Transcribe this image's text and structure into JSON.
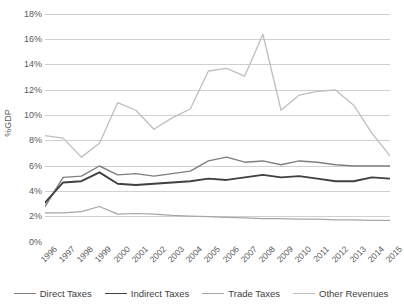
{
  "chart_data": {
    "type": "line",
    "title": "",
    "xlabel": "",
    "ylabel": "%GDP",
    "grid": true,
    "legend_position": "bottom",
    "ylim": [
      0,
      18
    ],
    "ytick_step": 2,
    "ytick_labels": [
      "0%",
      "2%",
      "4%",
      "6%",
      "8%",
      "10%",
      "12%",
      "14%",
      "16%",
      "18%"
    ],
    "ytick_values": [
      0,
      2,
      4,
      6,
      8,
      10,
      12,
      14,
      16,
      18
    ],
    "categories": [
      "1996",
      "1997",
      "1998",
      "1999",
      "2000",
      "2001",
      "2002",
      "2003",
      "2004",
      "2005",
      "2006",
      "2007",
      "2008",
      "2009",
      "2010",
      "2011",
      "2012",
      "2013",
      "2014",
      "2015"
    ],
    "series": [
      {
        "name": "Direct Taxes",
        "color": "#7f7f7f",
        "width": 1.4,
        "values": [
          2.8,
          5.1,
          5.2,
          6.0,
          5.3,
          5.4,
          5.2,
          5.4,
          5.6,
          6.4,
          6.7,
          6.3,
          6.4,
          6.1,
          6.4,
          6.3,
          6.1,
          6.0,
          6.0,
          6.0
        ]
      },
      {
        "name": "Indirect Taxes",
        "color": "#404040",
        "width": 1.9,
        "values": [
          3.1,
          4.7,
          4.8,
          5.5,
          4.6,
          4.5,
          4.6,
          4.7,
          4.8,
          5.0,
          4.9,
          5.1,
          5.3,
          5.1,
          5.2,
          5.0,
          4.8,
          4.8,
          5.1,
          5.0
        ]
      },
      {
        "name": "Trade Taxes",
        "color": "#a6a6a6",
        "width": 1.2,
        "values": [
          2.3,
          2.3,
          2.4,
          2.8,
          2.2,
          2.25,
          2.2,
          2.1,
          2.05,
          2.0,
          1.95,
          1.9,
          1.85,
          1.85,
          1.8,
          1.8,
          1.75,
          1.75,
          1.7,
          1.7
        ]
      },
      {
        "name": "Other Revenues",
        "color": "#bfbfbf",
        "width": 1.3,
        "values": [
          8.4,
          8.2,
          6.7,
          7.8,
          11.0,
          10.4,
          8.9,
          9.8,
          10.5,
          13.5,
          13.7,
          13.1,
          16.4,
          10.4,
          11.6,
          11.9,
          12.0,
          10.8,
          8.6,
          6.8
        ]
      }
    ]
  },
  "legend": {
    "items": [
      {
        "label": "Direct Taxes"
      },
      {
        "label": "Indirect Taxes"
      },
      {
        "label": "Trade Taxes"
      },
      {
        "label": "Other Revenues"
      }
    ]
  },
  "colors": {
    "gridline": "#d0d0d0",
    "text": "#595959",
    "background": "#ffffff"
  }
}
